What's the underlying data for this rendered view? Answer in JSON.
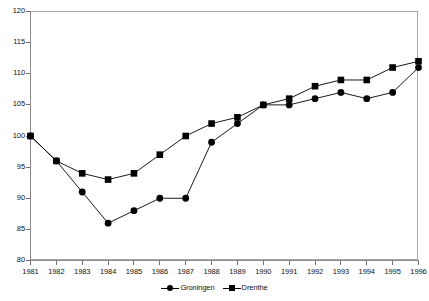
{
  "chart_data": {
    "type": "line",
    "title": "",
    "subtitle": "",
    "xlabel": "",
    "ylabel": "",
    "x": [
      1981,
      1982,
      1983,
      1984,
      1985,
      1986,
      1987,
      1988,
      1989,
      1990,
      1991,
      1992,
      1993,
      1994,
      1995,
      1996
    ],
    "categories": [
      "1981",
      "1982",
      "1983",
      "1984",
      "1985",
      "1986",
      "1987",
      "1988",
      "1989",
      "1990",
      "1991",
      "1992",
      "1993",
      "1994",
      "1995",
      "1996"
    ],
    "series": [
      {
        "name": "Groningen",
        "marker": "circle",
        "color": "#000000",
        "values": [
          100,
          96,
          91,
          86,
          88,
          90,
          90,
          99,
          102,
          105,
          105,
          106,
          107,
          106,
          107,
          111
        ]
      },
      {
        "name": "Drenthe",
        "marker": "square",
        "color": "#000000",
        "values": [
          100,
          96,
          94,
          93,
          94,
          97,
          100,
          102,
          103,
          105,
          106,
          108,
          109,
          109,
          111,
          112
        ]
      }
    ],
    "ylim": [
      80,
      120
    ],
    "yticks": [
      80,
      85,
      90,
      95,
      100,
      105,
      110,
      115,
      120
    ],
    "ytick_labels": [
      "80",
      "85",
      "90",
      "95",
      "100",
      "105",
      "110",
      "115",
      "120"
    ],
    "xlim": [
      1981,
      1996
    ],
    "grid": false,
    "legend_position": "bottom-center",
    "legend_entries": [
      "Groningen",
      "Drenthe"
    ],
    "annotations": []
  },
  "legend": {
    "items": [
      {
        "label": "Groningen",
        "marker": "circle-marker-icon"
      },
      {
        "label": "Drenthe",
        "marker": "square-marker-icon"
      }
    ]
  }
}
